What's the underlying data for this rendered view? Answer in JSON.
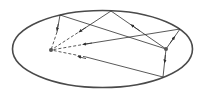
{
  "diagram": {
    "title": "",
    "colors": {
      "ellipse": "#4a4a4a",
      "rays": "#2f2f2f",
      "focus": "#555555",
      "background": "#ffffff"
    },
    "ellipse": {
      "cx": 102.5,
      "cy": 49,
      "rx": 90,
      "ry": 38.5
    },
    "foci": [
      {
        "id": "F1",
        "x": 51,
        "y": 50
      },
      {
        "id": "F2",
        "x": 166,
        "y": 49
      }
    ],
    "reflection_points": [
      {
        "id": "P_top",
        "x": 111,
        "y": 11
      },
      {
        "id": "P_upper_left",
        "x": 60,
        "y": 15
      },
      {
        "id": "P_upper_right",
        "x": 180,
        "y": 29
      },
      {
        "id": "P_lower_right",
        "x": 163,
        "y": 77
      }
    ],
    "rays": [
      {
        "from": "F2",
        "to": "P_top",
        "style": "solid",
        "arrow": true
      },
      {
        "from": "P_top",
        "to": "F1",
        "style": "solid-then-dashed",
        "arrow": true
      },
      {
        "from": "F2",
        "to": "P_upper_left",
        "style": "solid",
        "arrow": false
      },
      {
        "from": "P_upper_left",
        "to": "F1",
        "style": "solid-then-dashed",
        "arrow": true
      },
      {
        "from": "F2",
        "to": "P_upper_right",
        "style": "solid",
        "arrow": true
      },
      {
        "from": "P_upper_right",
        "to": "F1",
        "style": "solid-then-dashed",
        "arrow": true
      },
      {
        "from": "F2",
        "to": "P_lower_right",
        "style": "solid",
        "arrow": true
      },
      {
        "from": "P_lower_right",
        "to": "F1",
        "style": "solid-then-dashed",
        "arrow": true
      }
    ]
  }
}
